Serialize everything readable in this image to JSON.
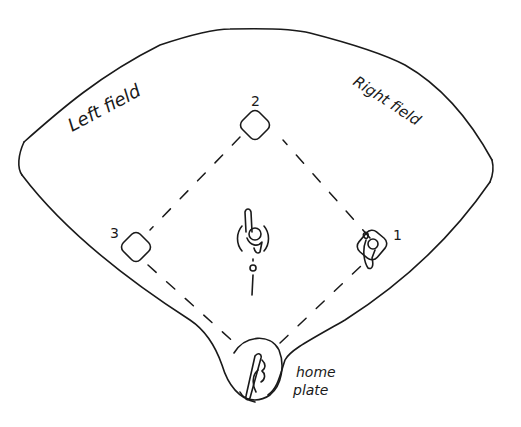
{
  "diagram": {
    "ink_color": "#1a1a1a",
    "background": "#ffffff",
    "labels": {
      "left_field": "Left field",
      "right_field": "Right field",
      "home_plate_line1": "home",
      "home_plate_line2": "plate"
    },
    "bases": [
      {
        "id": "first",
        "label": "1"
      },
      {
        "id": "second",
        "label": "2"
      },
      {
        "id": "third",
        "label": "3"
      }
    ],
    "players": [
      {
        "id": "pitcher",
        "description": "pitcher with arm raised on mound"
      },
      {
        "id": "first-baseman",
        "description": "fielder at first base"
      },
      {
        "id": "batter",
        "description": "batter at home plate"
      }
    ]
  }
}
